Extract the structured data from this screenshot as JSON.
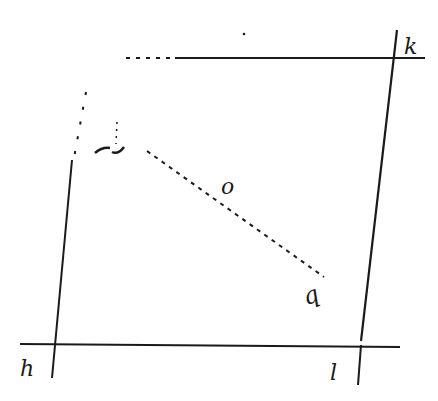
{
  "diagram": {
    "type": "geometric-figure",
    "colors": {
      "ink": "#1a1a1a",
      "background": "#ffffff"
    },
    "labels": {
      "k": "k",
      "h": "h",
      "l": "l",
      "o": "o",
      "q": "q",
      "p": "p"
    },
    "lines": [
      {
        "id": "top-line",
        "style": "solid",
        "from_label": "",
        "to_label": "k"
      },
      {
        "id": "bottom-line",
        "style": "solid",
        "from_label": "h",
        "to_label": "l"
      },
      {
        "id": "left-line",
        "style": "solid",
        "ends_at": "h"
      },
      {
        "id": "right-line",
        "style": "solid",
        "from_label": "k",
        "to_label": "l"
      },
      {
        "id": "dashed-segment",
        "style": "dashed",
        "from_label": "p",
        "through": "o",
        "to_label": "q"
      }
    ]
  }
}
